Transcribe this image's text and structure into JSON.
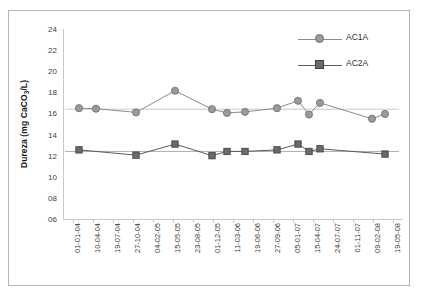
{
  "chart_data": {
    "type": "line",
    "title": "",
    "xlabel": "",
    "ylabel": "Dureza (mg CaCO3/L)",
    "ylabel_html": "Dureza (mg CaCO<sub>3</sub>/L)",
    "ylim": [
      6,
      24
    ],
    "yticks": [
      "24",
      "22",
      "20",
      "18",
      "16",
      "14",
      "12",
      "10",
      "08",
      "06"
    ],
    "ytick_values": [
      24,
      22,
      20,
      18,
      16,
      14,
      12,
      10,
      8,
      6
    ],
    "grid": false,
    "legend_position": "top-right",
    "categories": [
      "01-01-04",
      "10-04-04",
      "19-07-04",
      "27-10-04",
      "04-02-05",
      "15-05-05",
      "23-08-05",
      "01-12-05",
      "11-03-06",
      "19-06-06",
      "27-09-06",
      "05-01-07",
      "15-04-07",
      "24-07-07",
      "01-11-07",
      "09-02-08",
      "19-05-08"
    ],
    "series": [
      {
        "name": "AC1A",
        "marker": "circle",
        "color": "#8c8c8c",
        "points": [
          {
            "x": 0.3,
            "y": 16.5
          },
          {
            "x": 1.15,
            "y": 16.45
          },
          {
            "x": 3.15,
            "y": 16.1
          },
          {
            "x": 5.1,
            "y": 18.15
          },
          {
            "x": 6.95,
            "y": 16.4
          },
          {
            "x": 7.7,
            "y": 16.05
          },
          {
            "x": 8.6,
            "y": 16.15
          },
          {
            "x": 10.2,
            "y": 16.5
          },
          {
            "x": 11.25,
            "y": 17.2
          },
          {
            "x": 11.8,
            "y": 15.9
          },
          {
            "x": 12.35,
            "y": 17.0
          },
          {
            "x": 14.95,
            "y": 15.5
          },
          {
            "x": 15.6,
            "y": 15.95
          }
        ],
        "trendline_y": 16.4
      },
      {
        "name": "AC2A",
        "marker": "square",
        "color": "#5a5a5a",
        "points": [
          {
            "x": 0.3,
            "y": 12.55
          },
          {
            "x": 3.15,
            "y": 12.05
          },
          {
            "x": 5.1,
            "y": 13.1
          },
          {
            "x": 6.95,
            "y": 12.0
          },
          {
            "x": 7.7,
            "y": 12.4
          },
          {
            "x": 8.6,
            "y": 12.4
          },
          {
            "x": 10.2,
            "y": 12.55
          },
          {
            "x": 11.25,
            "y": 13.1
          },
          {
            "x": 11.8,
            "y": 12.4
          },
          {
            "x": 12.35,
            "y": 12.65
          },
          {
            "x": 15.6,
            "y": 12.15
          }
        ],
        "trendline_y": 12.4
      }
    ]
  },
  "legend": {
    "items": [
      {
        "label": "AC1A",
        "marker": "circle",
        "color": "#8c8c8c"
      },
      {
        "label": "AC2A",
        "marker": "square",
        "color": "#5a5a5a"
      }
    ]
  }
}
